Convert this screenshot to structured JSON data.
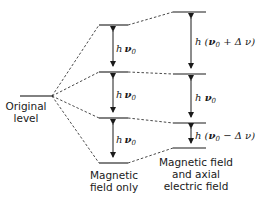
{
  "diagram": {
    "type": "energy-level-splitting",
    "columns": {
      "original": {
        "label_line1": "Original",
        "label_line2": "level"
      },
      "magnetic": {
        "label_line1": "Magnetic",
        "label_line2": "field only",
        "gaps": [
          {
            "h": "h",
            "nu": "ν",
            "sub": "0",
            "rest": ""
          },
          {
            "h": "h",
            "nu": "ν",
            "sub": "0",
            "rest": ""
          },
          {
            "h": "h",
            "nu": "ν",
            "sub": "0",
            "rest": ""
          }
        ]
      },
      "magnetic_electric": {
        "label_line1": "Magnetic field",
        "label_line2": "and axial",
        "label_line3": "electric field",
        "gaps": [
          {
            "prefix": "h (",
            "nu": "ν",
            "sub": "0",
            "rest": " + Δ ν)"
          },
          {
            "prefix": "h ",
            "nu": "ν",
            "sub": "0",
            "rest": ""
          },
          {
            "prefix": "h (",
            "nu": "ν",
            "sub": "0",
            "rest": " − Δ ν)"
          }
        ]
      }
    },
    "colors": {
      "line": "#1a1a1a",
      "background": "#ffffff"
    }
  }
}
